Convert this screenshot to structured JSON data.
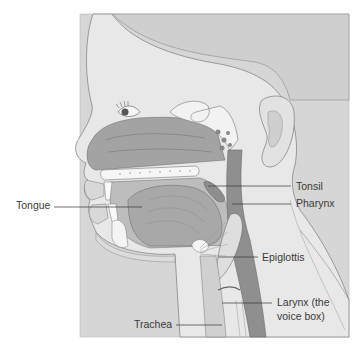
{
  "diagram": {
    "labels": [
      {
        "id": "tongue",
        "text": "Tongue"
      },
      {
        "id": "tonsil",
        "text": "Tonsil"
      },
      {
        "id": "pharynx",
        "text": "Pharynx"
      },
      {
        "id": "epiglottis",
        "text": "Epiglottis"
      },
      {
        "id": "larynx_line1",
        "text": "Larynx (the"
      },
      {
        "id": "larynx_line2",
        "text": "voice box)"
      },
      {
        "id": "trachea",
        "text": "Trachea"
      }
    ],
    "colors": {
      "background": "#ffffff",
      "skin": "#e6e6e6",
      "scalp": "#d4d4d4",
      "cavity": "#9c9c9c",
      "airway": "#8a8a8a",
      "tissue": "#b5b5b5",
      "bone": "#f4f4f4",
      "outline": "#6e6e6e",
      "leader": "#333333",
      "text": "#3a3a3a"
    }
  }
}
